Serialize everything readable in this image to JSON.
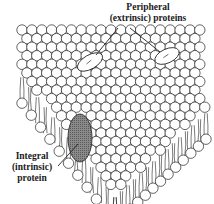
{
  "diagram": {
    "labels": {
      "peripheral": {
        "line1": "Peripheral",
        "line2": "(extrinsic) proteins"
      },
      "integral": {
        "line1": "Integral",
        "line2": "(intrinsic)",
        "line3": "protein"
      }
    },
    "colors": {
      "stroke": "#222222",
      "head_fill": "#ffffff",
      "integral_fill": "#8a8a8a",
      "background": "#ffffff"
    },
    "membrane": {
      "back_left": [
        22,
        30
      ],
      "back_right": [
        200,
        30
      ],
      "left_corner": [
        22,
        72
      ],
      "right_corner": [
        206,
        108
      ],
      "front_tip": [
        115,
        192
      ],
      "head_radius": 5.2,
      "tail_length": 26
    },
    "peripheral_proteins": [
      {
        "cx": 90,
        "cy": 62,
        "rx": 14,
        "ry": 7,
        "rotate": -30
      },
      {
        "cx": 167,
        "cy": 56,
        "rx": 13,
        "ry": 7,
        "rotate": -25
      }
    ],
    "integral_protein": {
      "cx": 80,
      "cy": 138,
      "rx": 12,
      "ry": 24
    },
    "leader_lines": [
      {
        "from": [
          118,
          28
        ],
        "to": [
          96,
          55
        ]
      },
      {
        "from": [
          130,
          28
        ],
        "to": [
          160,
          52
        ]
      },
      {
        "from": [
          58,
          166
        ],
        "to": [
          78,
          144
        ]
      }
    ]
  }
}
